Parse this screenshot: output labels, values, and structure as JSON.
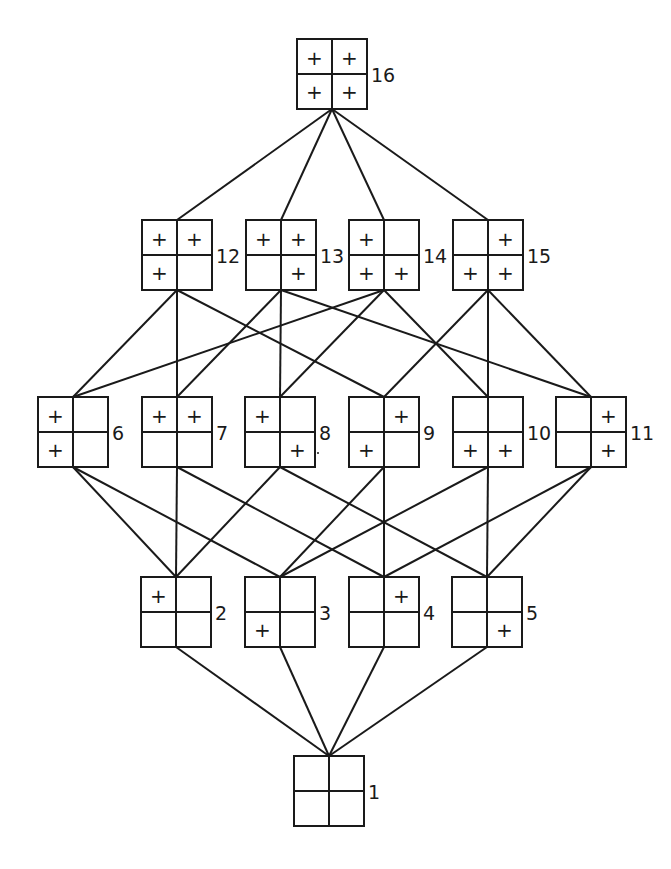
{
  "colors": {
    "ink": "#1a1a1a",
    "background": "#ffffff"
  },
  "box_size": 70,
  "nodes": [
    {
      "id": 16,
      "label": "16",
      "x": 297,
      "y": 39,
      "cells": {
        "tl": "+",
        "tr": "+",
        "bl": "+",
        "br": "+"
      }
    },
    {
      "id": 12,
      "label": "12",
      "x": 142,
      "y": 220,
      "cells": {
        "tl": "+",
        "tr": "+",
        "bl": "+",
        "br": ""
      }
    },
    {
      "id": 13,
      "label": "13",
      "x": 246,
      "y": 220,
      "cells": {
        "tl": "+",
        "tr": "+",
        "bl": "",
        "br": "+"
      }
    },
    {
      "id": 14,
      "label": "14",
      "x": 349,
      "y": 220,
      "cells": {
        "tl": "+",
        "tr": "",
        "bl": "+",
        "br": "+"
      }
    },
    {
      "id": 15,
      "label": "15",
      "x": 453,
      "y": 220,
      "cells": {
        "tl": "",
        "tr": "+",
        "bl": "+",
        "br": "+"
      }
    },
    {
      "id": 6,
      "label": "6",
      "x": 38,
      "y": 397,
      "cells": {
        "tl": "+",
        "tr": "",
        "bl": "+",
        "br": ""
      }
    },
    {
      "id": 7,
      "label": "7",
      "x": 142,
      "y": 397,
      "cells": {
        "tl": "+",
        "tr": "+",
        "bl": "",
        "br": ""
      }
    },
    {
      "id": 8,
      "label": "8",
      "x": 245,
      "y": 397,
      "cells": {
        "tl": "+",
        "tr": "",
        "bl": "",
        "br": "+"
      }
    },
    {
      "id": 9,
      "label": "9",
      "x": 349,
      "y": 397,
      "cells": {
        "tl": "",
        "tr": "+",
        "bl": "+",
        "br": ""
      }
    },
    {
      "id": 10,
      "label": "10",
      "x": 453,
      "y": 397,
      "cells": {
        "tl": "",
        "tr": "",
        "bl": "+",
        "br": "+"
      }
    },
    {
      "id": 11,
      "label": "11",
      "x": 556,
      "y": 397,
      "cells": {
        "tl": "",
        "tr": "+",
        "bl": "",
        "br": "+"
      }
    },
    {
      "id": 2,
      "label": "2",
      "x": 141,
      "y": 577,
      "cells": {
        "tl": "+",
        "tr": "",
        "bl": "",
        "br": ""
      }
    },
    {
      "id": 3,
      "label": "3",
      "x": 245,
      "y": 577,
      "cells": {
        "tl": "",
        "tr": "",
        "bl": "+",
        "br": ""
      }
    },
    {
      "id": 4,
      "label": "4",
      "x": 349,
      "y": 577,
      "cells": {
        "tl": "",
        "tr": "+",
        "bl": "",
        "br": ""
      }
    },
    {
      "id": 5,
      "label": "5",
      "x": 452,
      "y": 577,
      "cells": {
        "tl": "",
        "tr": "",
        "bl": "",
        "br": "+"
      }
    },
    {
      "id": 1,
      "label": "1",
      "x": 294,
      "y": 756,
      "cells": {
        "tl": "",
        "tr": "",
        "bl": "",
        "br": ""
      }
    }
  ],
  "edges": [
    [
      16,
      12
    ],
    [
      16,
      13
    ],
    [
      16,
      14
    ],
    [
      16,
      15
    ],
    [
      12,
      6
    ],
    [
      12,
      7
    ],
    [
      12,
      9
    ],
    [
      13,
      7
    ],
    [
      13,
      8
    ],
    [
      13,
      11
    ],
    [
      14,
      6
    ],
    [
      14,
      8
    ],
    [
      14,
      10
    ],
    [
      15,
      9
    ],
    [
      15,
      10
    ],
    [
      15,
      11
    ],
    [
      6,
      2
    ],
    [
      6,
      3
    ],
    [
      7,
      2
    ],
    [
      7,
      4
    ],
    [
      8,
      2
    ],
    [
      8,
      5
    ],
    [
      9,
      3
    ],
    [
      9,
      4
    ],
    [
      10,
      3
    ],
    [
      10,
      5
    ],
    [
      11,
      4
    ],
    [
      11,
      5
    ],
    [
      2,
      1
    ],
    [
      3,
      1
    ],
    [
      4,
      1
    ],
    [
      5,
      1
    ]
  ],
  "annotations": [
    {
      "name": "stray-dot",
      "x": 318,
      "y": 453
    }
  ]
}
